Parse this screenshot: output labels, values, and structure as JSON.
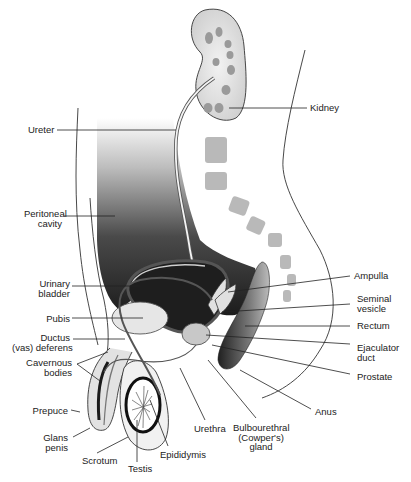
{
  "diagram": {
    "labels": {
      "kidney": [
        "Kidney"
      ],
      "ureter": [
        "Ureter"
      ],
      "peritoneal_cavity": [
        "Peritoneal",
        "cavity"
      ],
      "urinary_bladder": [
        "Urinary",
        "bladder"
      ],
      "pubis": [
        "Pubis"
      ],
      "ductus_deferens": [
        "Ductus",
        "(vas) deferens"
      ],
      "cavernous_bodies": [
        "Cavernous",
        "bodies"
      ],
      "prepuce": [
        "Prepuce"
      ],
      "glans_penis": [
        "Glans",
        "penis"
      ],
      "scrotum": [
        "Scrotum"
      ],
      "testis": [
        "Testis"
      ],
      "epididymis": [
        "Epididymis"
      ],
      "urethra": [
        "Urethra"
      ],
      "bulbourethral_gland": [
        "Bulbourethral",
        "(Cowper's)",
        "gland"
      ],
      "anus": [
        "Anus"
      ],
      "prostate": [
        "Prostate"
      ],
      "ejaculator_duct": [
        "Ejaculator",
        "duct"
      ],
      "rectum": [
        "Rectum"
      ],
      "seminal_vesicle": [
        "Seminal",
        "vesicle"
      ],
      "ampulla": [
        "Ampulla"
      ]
    },
    "colors": {
      "line": "#222222",
      "dark_fill": "#2a2a2a",
      "mid_fill": "#8a8a8a",
      "light_fill": "#d8d8d8",
      "background": "#ffffff"
    }
  }
}
